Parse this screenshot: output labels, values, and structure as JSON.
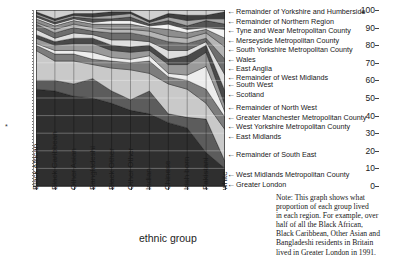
{
  "chart_data": {
    "type": "area",
    "title": "",
    "xlabel": "ethnic group",
    "ylabel": "",
    "ylim": [
      0,
      100
    ],
    "ytick_labels": [
      "100",
      "90",
      "80",
      "70",
      "60",
      "50",
      "40",
      "30",
      "20",
      "10",
      "0"
    ],
    "ytick_values": [
      100,
      90,
      80,
      70,
      60,
      50,
      40,
      30,
      20,
      10,
      0
    ],
    "grid": true,
    "legend_position": "right",
    "stacked_percent": true,
    "categories": [
      "Black African",
      "Black Caribbean",
      "Other Asian",
      "Bangladeshi",
      "Black Other",
      "Other Other",
      "Indian",
      "Chinese",
      "Irish born",
      "Pakistani",
      "white"
    ],
    "series": [
      {
        "name": "Greater London",
        "shade": "#2f2f2f",
        "values": [
          55,
          54,
          51,
          50,
          47,
          43,
          41,
          36,
          33,
          19,
          10
        ]
      },
      {
        "name": "West Midlands Metropolitan County",
        "shade": "#5c5c5c",
        "values": [
          5,
          6,
          7,
          11,
          7,
          6,
          13,
          5,
          6,
          19,
          4
        ]
      },
      {
        "name": "Remainder of South East",
        "shade": "#c9c9c9",
        "values": [
          17,
          11,
          13,
          8,
          13,
          17,
          10,
          17,
          16,
          9,
          18
        ]
      },
      {
        "name": "East Midlands",
        "shade": "#7d7d7d",
        "values": [
          3,
          4,
          4,
          3,
          4,
          4,
          7,
          4,
          5,
          8,
          7
        ]
      },
      {
        "name": "West Yorkshire Metropolitan County",
        "shade": "#ededed",
        "values": [
          1,
          2,
          2,
          4,
          2,
          2,
          3,
          2,
          3,
          13,
          3
        ]
      },
      {
        "name": "Greater Manchester Metropolitan County",
        "shade": "#9a9a9a",
        "values": [
          3,
          3,
          4,
          5,
          4,
          4,
          3,
          5,
          6,
          8,
          4
        ]
      },
      {
        "name": "Remainder of North West",
        "shade": "#4a4a4a",
        "values": [
          2,
          2,
          3,
          3,
          3,
          3,
          3,
          3,
          5,
          4,
          8
        ]
      },
      {
        "name": "Scotland",
        "shade": "#dedede",
        "values": [
          3,
          2,
          3,
          2,
          3,
          4,
          2,
          5,
          3,
          2,
          9
        ]
      },
      {
        "name": "South West",
        "shade": "#6e6e6e",
        "values": [
          3,
          3,
          3,
          2,
          4,
          4,
          3,
          5,
          4,
          2,
          9
        ]
      },
      {
        "name": "Remainder of West Midlands",
        "shade": "#b5b5b5",
        "values": [
          1,
          2,
          2,
          2,
          2,
          2,
          3,
          3,
          3,
          3,
          7
        ]
      },
      {
        "name": "East Anglia",
        "shade": "#8e8e8e",
        "values": [
          2,
          2,
          2,
          2,
          3,
          3,
          2,
          4,
          3,
          2,
          5
        ]
      },
      {
        "name": "Wales",
        "shade": "#f2f2f2",
        "values": [
          1,
          1,
          1,
          1,
          2,
          2,
          1,
          3,
          2,
          1,
          5
        ]
      },
      {
        "name": "South Yorkshire Metropolitan County",
        "shade": "#555555",
        "values": [
          1,
          1,
          1,
          2,
          1,
          2,
          1,
          2,
          2,
          4,
          3
        ]
      },
      {
        "name": "Merseyside Metropolitan County",
        "shade": "#a6a6a6",
        "values": [
          1,
          1,
          1,
          1,
          2,
          2,
          1,
          2,
          3,
          1,
          3
        ]
      },
      {
        "name": "Remainder of Northern Region",
        "shade": "#3f3f3f",
        "values": [
          1,
          1,
          1,
          2,
          2,
          1,
          1,
          2,
          3,
          2,
          4
        ]
      },
      {
        "name": "Remainder of Yorkshire and Humberside",
        "shade": "#d0d0d0",
        "values": [
          1,
          5,
          2,
          2,
          1,
          1,
          6,
          2,
          3,
          3,
          1
        ]
      }
    ]
  },
  "yaxis": {
    "ticks": [
      "100",
      "90",
      "80",
      "70",
      "60",
      "50",
      "40",
      "30",
      "20",
      "10",
      "0"
    ],
    "star_marker": "*"
  },
  "xaxis": {
    "title": "ethnic group",
    "labels": [
      "Black African",
      "Black Caribbean",
      "Other Asian",
      "Bangladeshi",
      "Black Other",
      "Other Other",
      "Indian",
      "Chinese",
      "Irish born",
      "Pakistani",
      "white"
    ]
  },
  "legend": {
    "arrow_glyph": "←",
    "items": [
      {
        "label": "Remainder of Yorkshire and Humberside"
      },
      {
        "label": "Remainder of Northern Region"
      },
      {
        "label": "Tyne and Wear Metropolitan County"
      },
      {
        "label": "Merseyside Metropolitan County"
      },
      {
        "label": "South Yorkshire Metropolitan County"
      },
      {
        "label": "Wales"
      },
      {
        "label": "East Anglia"
      },
      {
        "label": "Remainder of West Midlands"
      },
      {
        "label": "South West"
      },
      {
        "label": "Scotland"
      },
      {
        "label": "Remainder of North West"
      },
      {
        "label": "Greater Manchester Metropolitan County"
      },
      {
        "label": "West Yorkshire Metropolitan County"
      },
      {
        "label": "East Midlands"
      },
      {
        "label": "Remainder of South East"
      },
      {
        "label": "West Midlands Metropolitan County"
      },
      {
        "label": "Greater London"
      }
    ]
  },
  "note": {
    "lines": [
      "Note: This graph shows what",
      "proportion of each group lived",
      "in each region. For example, over",
      "half of all the Black African,",
      "Black Caribbean, Other Asian and",
      "Bangladeshi residents in Britain",
      "lived in Greater London in 1991."
    ]
  }
}
